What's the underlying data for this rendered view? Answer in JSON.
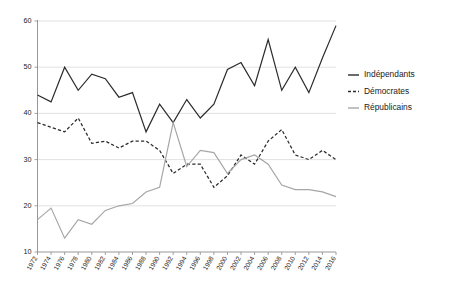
{
  "chart_data": {
    "type": "line",
    "title": "",
    "subtitle": "",
    "xlabel": "",
    "ylabel": "",
    "xlim": [
      1972,
      2016
    ],
    "ylim": [
      10,
      60
    ],
    "yticks": [
      10,
      20,
      30,
      40,
      50,
      60
    ],
    "grid": true,
    "legend_position": "right",
    "x": [
      1972,
      1974,
      1976,
      1978,
      1980,
      1982,
      1984,
      1986,
      1988,
      1990,
      1992,
      1994,
      1996,
      1998,
      2000,
      2002,
      2004,
      2006,
      2008,
      2010,
      2012,
      2014,
      2016
    ],
    "categories": [
      "1972",
      "1974",
      "1976",
      "1978",
      "1980",
      "1982",
      "1984",
      "1986",
      "1988",
      "1990",
      "1992",
      "1994",
      "1996",
      "1998",
      "2000",
      "2002",
      "2004",
      "2006",
      "2008",
      "2010",
      "2012",
      "2014",
      "2016"
    ],
    "series": [
      {
        "name": "Indépendants",
        "style": "solid",
        "color": "#2b2b2b",
        "values": [
          44.0,
          42.5,
          50.0,
          45.0,
          48.5,
          47.5,
          43.5,
          44.5,
          36.0,
          42.0,
          38.0,
          43.0,
          39.0,
          42.0,
          49.5,
          51.0,
          46.0,
          56.0,
          45.0,
          50.0,
          44.5,
          52.0,
          59.0
        ]
      },
      {
        "name": "Démocrates",
        "style": "dashed",
        "color": "#2b2b2b",
        "values": [
          38.0,
          37.0,
          36.0,
          39.0,
          33.5,
          34.0,
          32.5,
          34.0,
          34.0,
          32.0,
          27.0,
          29.0,
          29.0,
          24.0,
          26.5,
          31.0,
          29.0,
          34.0,
          36.5,
          31.0,
          30.0,
          32.0,
          30.0
        ]
      },
      {
        "name": "Républicains",
        "style": "solid",
        "color": "#a6a6a6",
        "values": [
          17.0,
          19.5,
          13.0,
          17.0,
          16.0,
          19.0,
          20.0,
          20.5,
          23.0,
          24.0,
          38.0,
          28.5,
          32.0,
          31.5,
          27.0,
          30.0,
          31.0,
          29.0,
          24.5,
          23.5,
          23.5,
          23.0,
          22.0
        ]
      }
    ]
  },
  "legend": {
    "items": [
      {
        "label": "Indépendants",
        "style": "solid",
        "color": "#2b2b2b"
      },
      {
        "label": "Démocrates",
        "style": "dashed",
        "color": "#2b2b2b"
      },
      {
        "label": "Républicains",
        "style": "solid",
        "color": "#a6a6a6"
      }
    ]
  }
}
